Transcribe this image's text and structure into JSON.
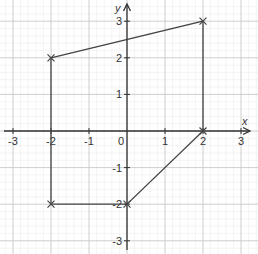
{
  "chart_data": {
    "type": "scatter",
    "title": "",
    "xlabel": "x",
    "ylabel": "y",
    "xlim": [
      -3.3,
      3.2
    ],
    "ylim": [
      -3.3,
      3.4
    ],
    "grid": true,
    "grid_minor_per_unit": 5,
    "x_ticks": [
      -3,
      -2,
      -1,
      0,
      1,
      2,
      3
    ],
    "x_tick_labels": [
      "-3",
      "-2",
      "-1",
      "0",
      "1",
      "2",
      "3"
    ],
    "y_ticks": [
      -3,
      -2,
      -1,
      1,
      2,
      3
    ],
    "y_tick_labels": [
      "-3",
      "-2",
      "-1",
      "1",
      "2",
      "3"
    ],
    "series": [
      {
        "name": "polygon",
        "closed": true,
        "marker": "x",
        "points": [
          {
            "x": -2,
            "y": 2
          },
          {
            "x": 2,
            "y": 3
          },
          {
            "x": 2,
            "y": 0
          },
          {
            "x": 0,
            "y": -2
          },
          {
            "x": -2,
            "y": -2
          }
        ]
      }
    ]
  },
  "colors": {
    "background": "#ffffff",
    "grid_minor": "#ececec",
    "grid_major": "#c8c8c8",
    "axis": "#333333",
    "shape": "#444444"
  },
  "layout": {
    "origin_px": [
      127,
      131
    ],
    "unit_x_px": 38,
    "unit_y_px": 36.6
  }
}
